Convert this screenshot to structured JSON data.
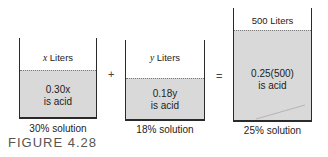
{
  "figure_label": "FIGURE 4.28",
  "operators": {
    "plus": "+",
    "equals": "="
  },
  "containers": [
    {
      "volume_var": "x",
      "volume_unit": "Liters",
      "acid_amount": "0.30x",
      "acid_label": "is acid",
      "caption": "30% solution"
    },
    {
      "volume_var": "y",
      "volume_unit": "Liters",
      "acid_amount": "0.18y",
      "acid_label": "is acid",
      "caption": "18% solution"
    },
    {
      "volume_var": "500",
      "volume_unit": "Liters",
      "acid_amount": "0.25(500)",
      "acid_label": "is acid",
      "caption": "25% solution"
    }
  ],
  "colors": {
    "liquid": "#d9d9d9",
    "outline": "#2a2a2a"
  }
}
